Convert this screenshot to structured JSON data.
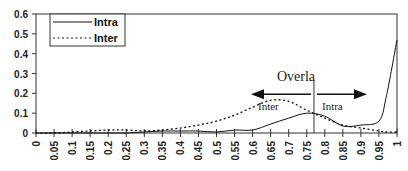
{
  "chart_data": {
    "type": "line",
    "title": "",
    "xlabel": "",
    "ylabel": "",
    "xlim": [
      0,
      1
    ],
    "ylim": [
      0,
      0.6
    ],
    "grid": false,
    "legend_position": "top-left",
    "x_ticks": [
      "0",
      "0.05",
      "0.1",
      "0.15",
      "0.2",
      "0.25",
      "0.3",
      "0.35",
      "0.4",
      "0.45",
      "0.5",
      "0.55",
      "0.6",
      "0.65",
      "0.7",
      "0.75",
      "0.8",
      "0.85",
      "0.9",
      "0.95",
      "1"
    ],
    "y_ticks": [
      "0",
      "0.1",
      "0.2",
      "0.3",
      "0.4",
      "0.5",
      "0.6"
    ],
    "x": [
      0,
      0.05,
      0.1,
      0.15,
      0.2,
      0.25,
      0.3,
      0.35,
      0.4,
      0.45,
      0.5,
      0.55,
      0.6,
      0.65,
      0.7,
      0.75,
      0.8,
      0.85,
      0.9,
      0.95,
      0.97,
      1
    ],
    "series": [
      {
        "name": "Intra",
        "style": "solid",
        "values": [
          0,
          0,
          0,
          0,
          0,
          0,
          0.005,
          0.01,
          0.01,
          0.01,
          0.005,
          0.015,
          0.015,
          0.045,
          0.075,
          0.1,
          0.085,
          0.035,
          0.04,
          0.06,
          0.18,
          0.47
        ]
      },
      {
        "name": "Inter",
        "style": "dotted",
        "values": [
          0,
          0,
          0.005,
          0.01,
          0.015,
          0.015,
          0.01,
          0.015,
          0.025,
          0.04,
          0.06,
          0.09,
          0.13,
          0.165,
          0.16,
          0.115,
          0.075,
          0.04,
          0.025,
          0.01,
          0.005,
          0.005
        ]
      }
    ],
    "annotations": {
      "overlap_label": "Overla",
      "overlap_x": 0.77,
      "left_arrow_label": "Inter",
      "right_arrow_label": "Intra"
    }
  }
}
